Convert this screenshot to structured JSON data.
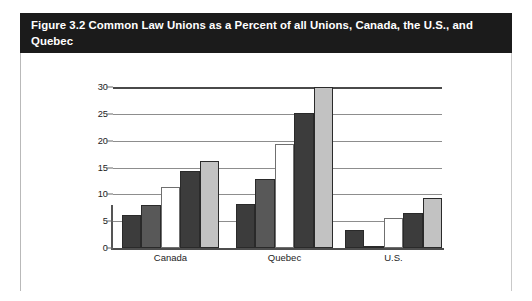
{
  "figure": {
    "title": "Figure 3.2 Common Law Unions as a Percent of all Unions, Canada, the U.S., and Quebec",
    "title_bar_color": "#1b1b1b",
    "title_text_color": "#ffffff"
  },
  "chart_data": {
    "type": "bar",
    "title": "Figure 3.2 Common Law Unions as a Percent of all Unions, Canada, the U.S., and Quebec",
    "xlabel": "",
    "ylabel": "",
    "ylim": [
      0,
      30
    ],
    "yticks": [
      0,
      5,
      10,
      15,
      20,
      25,
      30
    ],
    "ytick_labels": [
      "0",
      "5",
      "10",
      "15",
      "20",
      "25",
      "30"
    ],
    "grid": true,
    "legend": "none",
    "categories": [
      "Canada",
      "Quebec",
      "U.S."
    ],
    "series": [
      {
        "name": "series-1",
        "color": "#3c3c3c",
        "values": [
          6.2,
          8.2,
          3.3
        ]
      },
      {
        "name": "series-2",
        "color": "#585858",
        "values": [
          8.0,
          12.8,
          0.2
        ]
      },
      {
        "name": "series-3",
        "color": "#ffffff",
        "values": [
          11.3,
          19.3,
          5.5
        ]
      },
      {
        "name": "series-4",
        "color": "#3c3c3c",
        "values": [
          14.4,
          25.2,
          6.6
        ]
      },
      {
        "name": "series-5",
        "color": "#c2c2c2",
        "values": [
          16.2,
          30.0,
          9.4
        ]
      }
    ]
  },
  "source_note": ""
}
